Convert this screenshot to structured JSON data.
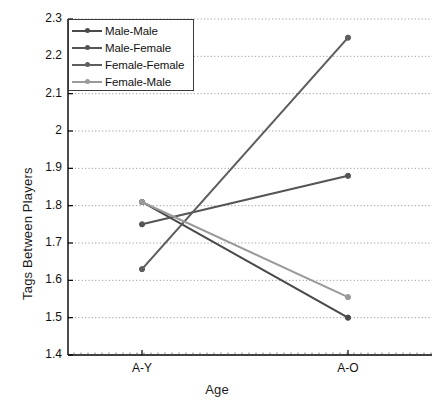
{
  "chart_data": {
    "type": "line",
    "title": "",
    "xlabel": "Age",
    "ylabel": "Tags Between Players",
    "categories": [
      "A-Y",
      "A-O"
    ],
    "x": [
      0,
      1
    ],
    "ylim": [
      1.4,
      2.3
    ],
    "yticks": [
      "1.4",
      "1.5",
      "1.6",
      "1.7",
      "1.8",
      "1.9",
      "2",
      "2.1",
      "2.2",
      "2.3"
    ],
    "ytick_values": [
      1.4,
      1.5,
      1.6,
      1.7,
      1.8,
      1.9,
      2.0,
      2.1,
      2.2,
      2.3
    ],
    "grid": "horizontal-dotted",
    "legend_position": "top-left",
    "series": [
      {
        "name": "Male-Male",
        "values": [
          1.81,
          1.5
        ],
        "color": "#4a4a4a",
        "marker": "circle"
      },
      {
        "name": "Male-Female",
        "values": [
          1.75,
          1.88
        ],
        "color": "#555555",
        "marker": "circle"
      },
      {
        "name": "Female-Female",
        "values": [
          1.63,
          2.25
        ],
        "color": "#5e5e5e",
        "marker": "circle"
      },
      {
        "name": "Female-Male",
        "values": [
          1.81,
          1.555
        ],
        "color": "#9a9a9a",
        "marker": "circle"
      }
    ]
  },
  "legend": {
    "items": [
      {
        "label": "Male-Male"
      },
      {
        "label": "Male-Female"
      },
      {
        "label": "Female-Female"
      },
      {
        "label": "Female-Male"
      }
    ]
  },
  "axes": {
    "x_title": "Age",
    "y_title": "Tags Between Players",
    "x_tick_labels": [
      "A-Y",
      "A-O"
    ],
    "y_tick_labels": [
      "2.3",
      "2.2",
      "2.1",
      "2",
      "1.9",
      "1.8",
      "1.7",
      "1.6",
      "1.5",
      "1.4"
    ]
  }
}
